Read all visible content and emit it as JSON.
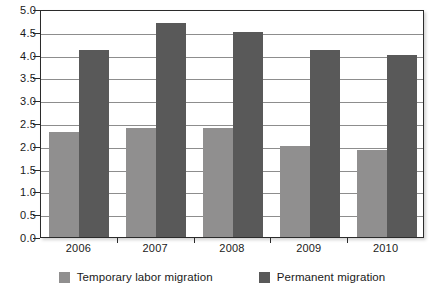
{
  "chart_data": {
    "type": "bar",
    "title": "",
    "xlabel": "",
    "ylabel": "",
    "categories": [
      "2006",
      "2007",
      "2008",
      "2009",
      "2010"
    ],
    "series": [
      {
        "name": "Temporary labor migration",
        "color": "#908f8f",
        "values": [
          2.3,
          2.4,
          2.4,
          2.0,
          1.9
        ]
      },
      {
        "name": "Permanent migration",
        "color": "#595959",
        "values": [
          4.1,
          4.7,
          4.5,
          4.1,
          4.0
        ]
      }
    ],
    "ylim": [
      0.0,
      5.0
    ],
    "y_ticks": [
      "0.0",
      "0.5",
      "1.0",
      "1.5",
      "2.0",
      "2.5",
      "3.0",
      "3.5",
      "4.0",
      "4.5",
      "5.0"
    ],
    "y_tick_values": [
      0.0,
      0.5,
      1.0,
      1.5,
      2.0,
      2.5,
      3.0,
      3.5,
      4.0,
      4.5,
      5.0
    ],
    "grid": true,
    "legend_position": "bottom"
  },
  "legend": {
    "items": [
      {
        "label": "Temporary labor migration",
        "color": "#908f8f"
      },
      {
        "label": "Permanent migration",
        "color": "#595959"
      }
    ]
  }
}
